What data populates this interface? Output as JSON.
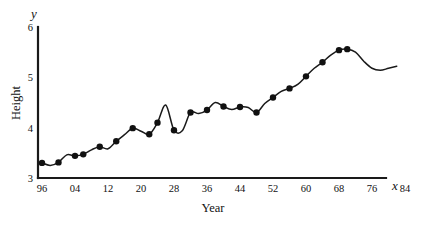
{
  "chart_data": {
    "type": "line",
    "title": "",
    "xlabel": "Year",
    "ylabel": "Height",
    "x_axis_symbol": "x",
    "y_axis_symbol": "y",
    "xlim": [
      96,
      96
    ],
    "ylim": [
      3,
      6
    ],
    "grid": false,
    "legend": null,
    "line_color": "#1a1a1a",
    "marker_color": "#111111",
    "marker_shape": "filled-circle",
    "xticks": [
      "96",
      "04",
      "12",
      "20",
      "28",
      "36",
      "44",
      "52",
      "60",
      "68",
      "76",
      "84",
      "92"
    ],
    "xtick_years": [
      0,
      8,
      16,
      24,
      32,
      40,
      48,
      56,
      64,
      72,
      80,
      88,
      96
    ],
    "yticks": [
      "3",
      "4",
      "5",
      "6"
    ],
    "ytick_values": [
      3,
      4,
      5,
      6
    ],
    "x": [
      0,
      2,
      4,
      6,
      8,
      10,
      12,
      14,
      16,
      18,
      20,
      22,
      24,
      26,
      28,
      30,
      32,
      34,
      36,
      38,
      40,
      42,
      44,
      46,
      48,
      50,
      52,
      54,
      56,
      58,
      60,
      62,
      64,
      66,
      68,
      70,
      72,
      74,
      76,
      78,
      80,
      82,
      84,
      86
    ],
    "y": [
      3.3,
      3.25,
      3.31,
      3.46,
      3.44,
      3.47,
      3.56,
      3.62,
      3.58,
      3.73,
      3.86,
      3.99,
      3.93,
      3.87,
      4.1,
      4.45,
      3.95,
      3.94,
      4.3,
      4.28,
      4.35,
      4.5,
      4.42,
      4.36,
      4.41,
      4.4,
      4.3,
      4.48,
      4.6,
      4.72,
      4.78,
      4.86,
      5.02,
      5.18,
      5.3,
      5.44,
      5.54,
      5.56,
      5.5,
      5.32,
      5.18,
      5.14,
      5.18,
      5.22
    ],
    "markers": [
      {
        "x": 0,
        "y": 3.3
      },
      {
        "x": 4,
        "y": 3.31
      },
      {
        "x": 8,
        "y": 3.44
      },
      {
        "x": 10,
        "y": 3.47
      },
      {
        "x": 14,
        "y": 3.62
      },
      {
        "x": 18,
        "y": 3.73
      },
      {
        "x": 22,
        "y": 3.99
      },
      {
        "x": 26,
        "y": 3.87
      },
      {
        "x": 28,
        "y": 4.1
      },
      {
        "x": 32,
        "y": 3.95
      },
      {
        "x": 36,
        "y": 4.3
      },
      {
        "x": 40,
        "y": 4.35
      },
      {
        "x": 44,
        "y": 4.42
      },
      {
        "x": 48,
        "y": 4.41
      },
      {
        "x": 52,
        "y": 4.3
      },
      {
        "x": 56,
        "y": 4.6
      },
      {
        "x": 60,
        "y": 4.78
      },
      {
        "x": 64,
        "y": 5.02
      },
      {
        "x": 68,
        "y": 5.3
      },
      {
        "x": 72,
        "y": 5.54
      },
      {
        "x": 74,
        "y": 5.56
      }
    ]
  }
}
